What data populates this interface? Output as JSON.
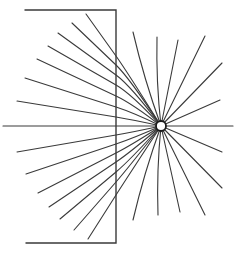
{
  "diagram": {
    "colors": {
      "line": "#3a3a3a",
      "charge_outline": "#1a1a1a",
      "background": "#ffffff"
    },
    "charge": {
      "cx": 161,
      "cy": 126,
      "r": 5
    },
    "slab": {
      "right_edge_x": 116,
      "top_y": 10,
      "bottom_y": 243,
      "top_left_x": 25,
      "bottom_left_x": 26
    },
    "axis": {
      "y": 126,
      "x_start": 3,
      "x_end": 233
    },
    "field_lines_left": [
      {
        "end": [
          86,
          14
        ],
        "cross": [
          116,
          56
        ]
      },
      {
        "end": [
          72,
          23
        ],
        "cross": [
          116,
          65
        ]
      },
      {
        "end": [
          58,
          33
        ],
        "cross": [
          116,
          75
        ]
      },
      {
        "end": [
          48,
          46
        ],
        "cross": [
          116,
          85
        ]
      },
      {
        "end": [
          37,
          59
        ],
        "cross": [
          116,
          96
        ]
      },
      {
        "end": [
          25,
          78
        ],
        "cross": [
          116,
          107
        ]
      },
      {
        "end": [
          17,
          101
        ],
        "cross": [
          116,
          117
        ]
      },
      {
        "end": [
          17,
          152
        ],
        "cross": [
          116,
          135
        ]
      },
      {
        "end": [
          26,
          174
        ],
        "cross": [
          116,
          144
        ]
      },
      {
        "end": [
          38,
          193
        ],
        "cross": [
          116,
          153
        ]
      },
      {
        "end": [
          49,
          207
        ],
        "cross": [
          116,
          162
        ]
      },
      {
        "end": [
          60,
          219
        ],
        "cross": [
          116,
          172
        ]
      },
      {
        "end": [
          74,
          230
        ],
        "cross": [
          116,
          182
        ]
      },
      {
        "end": [
          88,
          239
        ],
        "cross": [
          116,
          195
        ]
      }
    ],
    "field_lines_right": [
      [
        133,
        32
      ],
      [
        157,
        37
      ],
      [
        178,
        40
      ],
      [
        205,
        36
      ],
      [
        222,
        63
      ],
      [
        220,
        100
      ],
      [
        222,
        152
      ],
      [
        222,
        188
      ],
      [
        205,
        215
      ],
      [
        180,
        212
      ],
      [
        158,
        215
      ],
      [
        133,
        220
      ]
    ]
  }
}
